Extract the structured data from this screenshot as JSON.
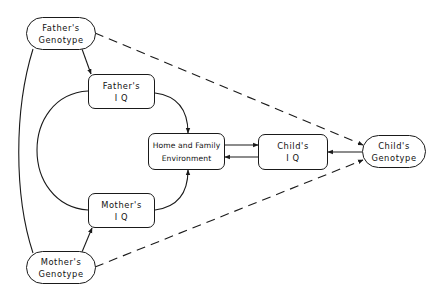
{
  "diagram": {
    "type": "path diagram",
    "nodes": {
      "father_genotype": {
        "line1": "Father's",
        "line2": "Genotype",
        "shape": "pill"
      },
      "father_iq": {
        "line1": "Father's",
        "line2": "I Q",
        "shape": "rounded-rect"
      },
      "home_env": {
        "line1": "Home and Family",
        "line2": "Environment",
        "shape": "rounded-rect"
      },
      "child_iq": {
        "line1": "Child's",
        "line2": "I Q",
        "shape": "rounded-rect"
      },
      "child_genotype": {
        "line1": "Child's",
        "line2": "Genotype",
        "shape": "pill"
      },
      "mother_iq": {
        "line1": "Mother's",
        "line2": "I Q",
        "shape": "rounded-rect"
      },
      "mother_genotype": {
        "line1": "Mother's",
        "line2": "Genotype",
        "shape": "pill"
      }
    },
    "edges": [
      {
        "from": "father_genotype",
        "to": "father_iq",
        "style": "solid",
        "arrow": true
      },
      {
        "from": "mother_genotype",
        "to": "mother_iq",
        "style": "solid",
        "arrow": true
      },
      {
        "from": "father_iq",
        "to": "home_env",
        "style": "solid",
        "arrow": true
      },
      {
        "from": "mother_iq",
        "to": "home_env",
        "style": "solid",
        "arrow": true
      },
      {
        "from": "home_env",
        "to": "child_iq",
        "style": "solid",
        "arrow": true
      },
      {
        "from": "child_iq",
        "to": "home_env",
        "style": "solid",
        "arrow": true
      },
      {
        "from": "child_genotype",
        "to": "child_iq",
        "style": "solid",
        "arrow": true
      },
      {
        "from": "father_genotype",
        "to": "child_genotype",
        "style": "dashed",
        "arrow": true
      },
      {
        "from": "mother_genotype",
        "to": "child_genotype",
        "style": "dashed",
        "arrow": true
      },
      {
        "from": "father_genotype",
        "to": "mother_genotype",
        "style": "solid-curve",
        "arrow": false
      },
      {
        "from": "father_iq",
        "to": "mother_iq",
        "style": "solid-curve",
        "arrow": false
      }
    ],
    "colors": {
      "line": "#1a1a1a",
      "background": "#ffffff"
    }
  }
}
